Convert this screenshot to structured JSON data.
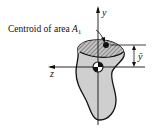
{
  "diagram": {
    "caption_label": "Centroid of area ",
    "caption_symbol": "A",
    "caption_subscript": "1",
    "axis_y_label": "y",
    "axis_z_label": "z",
    "dimension_label": "ȳ",
    "colors": {
      "shape_fill": "#cfcfcf",
      "hatch_fill": "#b5b5b5",
      "stroke": "#111111",
      "background": "#ffffff"
    }
  }
}
